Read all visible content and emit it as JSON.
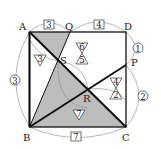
{
  "diagram": {
    "points": {
      "A": {
        "label": "A",
        "x": 29.5,
        "y": 32
      },
      "D": {
        "label": "D",
        "x": 126,
        "y": 32
      },
      "B": {
        "label": "B",
        "x": 29.5,
        "y": 127
      },
      "C": {
        "label": "C",
        "x": 126,
        "y": 127
      },
      "Q": {
        "label": "Q",
        "x": 70,
        "y": 32
      },
      "P": {
        "label": "P",
        "x": 126,
        "y": 65
      },
      "S": {
        "label": "S",
        "x": 58,
        "y": 61
      },
      "R": {
        "label": "R",
        "x": 88,
        "y": 89
      }
    },
    "boxed_labels": {
      "AQ": "3",
      "QD": "4",
      "BC": "7"
    },
    "circled_labels": {
      "DP": "1",
      "PC": "2",
      "AB": "3"
    },
    "triangle_labels": {
      "left_of_S": "3",
      "above_S_right": "6",
      "below_S_right": "5",
      "upper_near_R": "4",
      "lower_near_R": "2",
      "below_R": "7"
    },
    "colors": {
      "shade": "#bdbdbd",
      "line": "#111111",
      "thin": "#777777"
    }
  }
}
